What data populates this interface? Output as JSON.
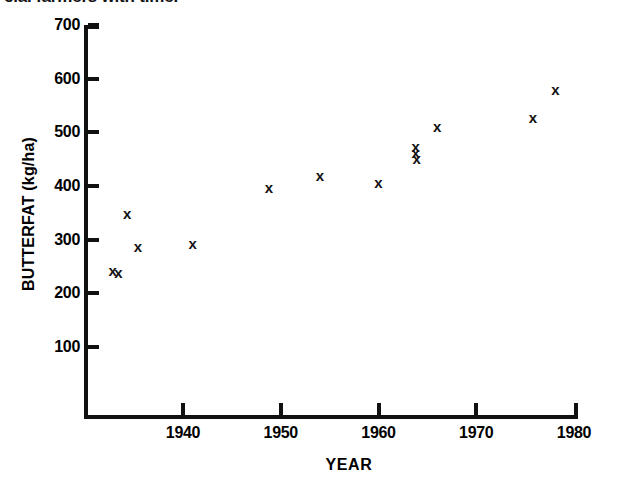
{
  "caption": {
    "text": "cial farmers with time."
  },
  "marker_glyph": "x",
  "chart_data": {
    "type": "scatter",
    "title": "",
    "xlabel": "YEAR",
    "ylabel": "BUTTERFAT (kg/ha)",
    "xlim": [
      1932,
      1980
    ],
    "ylim": [
      0,
      700
    ],
    "grid": false,
    "legend": "none",
    "xticks": [
      1940,
      1950,
      1960,
      1970,
      1980
    ],
    "xtick_labels": [
      "1940",
      "1950",
      "1960",
      "1970",
      "1980"
    ],
    "yticks": [
      100,
      200,
      300,
      400,
      500,
      600,
      700
    ],
    "ytick_labels": [
      "100",
      "200",
      "300",
      "400",
      "500",
      "600",
      "700"
    ],
    "series": [
      {
        "name": "Butterfat production",
        "marker": "x",
        "color": "#111111",
        "points": [
          {
            "x": 1932.8,
            "y": 242
          },
          {
            "x": 1933.4,
            "y": 238
          },
          {
            "x": 1934.3,
            "y": 348
          },
          {
            "x": 1935.4,
            "y": 287
          },
          {
            "x": 1941.0,
            "y": 291
          },
          {
            "x": 1948.8,
            "y": 396
          },
          {
            "x": 1954.0,
            "y": 418
          },
          {
            "x": 1960.0,
            "y": 405
          },
          {
            "x": 1963.8,
            "y": 472
          },
          {
            "x": 1963.8,
            "y": 462
          },
          {
            "x": 1963.9,
            "y": 450
          },
          {
            "x": 1966.0,
            "y": 510
          },
          {
            "x": 1975.8,
            "y": 527
          },
          {
            "x": 1978.1,
            "y": 578
          }
        ]
      }
    ]
  }
}
